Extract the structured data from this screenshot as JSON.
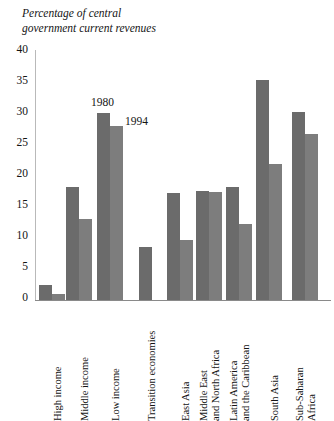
{
  "title": {
    "line1": "Percentage of central",
    "line2": "government current revenues"
  },
  "annotations": {
    "series1_label": "1980",
    "series2_label": "1994"
  },
  "colors": {
    "series1": "#6b6b6b",
    "series2": "#7d7d7d",
    "axis": "#8a8a8a",
    "text": "#141414"
  },
  "axis": {
    "y_ticks": [
      "0",
      "5",
      "10",
      "15",
      "20",
      "25",
      "30",
      "35",
      "40"
    ]
  },
  "categories_display": [
    {
      "l1": "High income",
      "l2": ""
    },
    {
      "l1": "Middle income",
      "l2": ""
    },
    {
      "l1": "Low income",
      "l2": ""
    },
    {
      "l1": "Transition economies",
      "l2": ""
    },
    {
      "l1": "East Asia",
      "l2": ""
    },
    {
      "l1": "Middle East",
      "l2": "and North Africa"
    },
    {
      "l1": "Latin America",
      "l2": "and the Caribbean"
    },
    {
      "l1": "South Asia",
      "l2": ""
    },
    {
      "l1": "Sub-Saharan",
      "l2": "Africa"
    }
  ],
  "chart_data": {
    "type": "bar",
    "title": "Percentage of central government current revenues",
    "xlabel": "",
    "ylabel": "Percentage of central government current revenues",
    "ylim": [
      0,
      40
    ],
    "yticks": [
      0,
      5,
      10,
      15,
      20,
      25,
      30,
      35,
      40
    ],
    "grid": false,
    "legend": "inline annotation labels above first pair of Low income bars",
    "categories": [
      "High income",
      "Middle income",
      "Low income",
      "Transition economies",
      "East Asia",
      "Middle East and North Africa",
      "Latin America and the Caribbean",
      "South Asia",
      "Sub-Saharan Africa"
    ],
    "series": [
      {
        "name": "1980",
        "color": "#6b6b6b",
        "values": [
          2.4,
          18.3,
          30.2,
          8.5,
          17.3,
          17.6,
          18.2,
          35.5,
          30.3
        ]
      },
      {
        "name": "1994",
        "color": "#7d7d7d",
        "values": [
          1.0,
          13.0,
          28.0,
          null,
          9.7,
          17.5,
          12.3,
          22.0,
          26.8
        ]
      }
    ]
  }
}
